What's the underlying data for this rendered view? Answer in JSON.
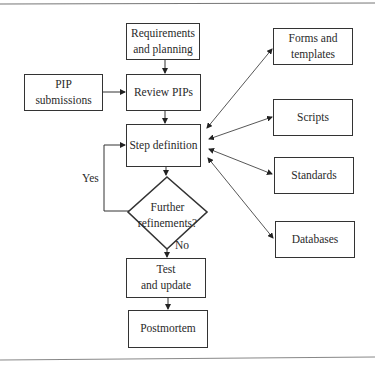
{
  "diagram": {
    "type": "flowchart",
    "nodes": {
      "requirements": "Requirements\nand planning",
      "pip_submissions": "PIP\nsubmissions",
      "review_pips": "Review PIPs",
      "step_definition": "Step definition",
      "decision": "Further\nrefinements?",
      "test_update": "Test\nand update",
      "postmortem": "Postmortem",
      "forms_templates": "Forms and\ntemplates",
      "scripts": "Scripts",
      "standards": "Standards",
      "databases": "Databases"
    },
    "edge_labels": {
      "yes": "Yes",
      "no": "No"
    },
    "edges": [
      {
        "from": "Requirements and planning",
        "to": "Review PIPs"
      },
      {
        "from": "PIP submissions",
        "to": "Review PIPs"
      },
      {
        "from": "Review PIPs",
        "to": "Step definition"
      },
      {
        "from": "Step definition",
        "to": "Further refinements?"
      },
      {
        "from": "Further refinements?",
        "to": "Step definition",
        "label": "Yes"
      },
      {
        "from": "Further refinements?",
        "to": "Test and update",
        "label": "No"
      },
      {
        "from": "Test and update",
        "to": "Postmortem"
      },
      {
        "from": "Step definition",
        "to": "Forms and templates",
        "bidirectional": true
      },
      {
        "from": "Step definition",
        "to": "Scripts",
        "bidirectional": true
      },
      {
        "from": "Step definition",
        "to": "Standards",
        "bidirectional": true
      },
      {
        "from": "Step definition",
        "to": "Databases",
        "bidirectional": true
      }
    ]
  }
}
